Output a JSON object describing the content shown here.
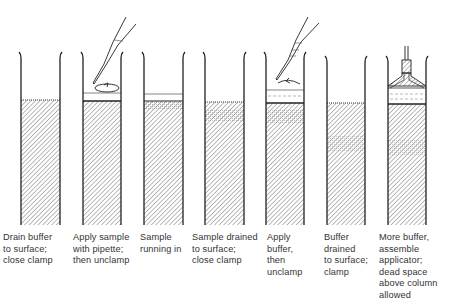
{
  "diagram": {
    "type": "column-chromatography-sample-loading-steps",
    "steps": [
      {
        "label": "Drain buffer\nto surface;\nclose clamp",
        "x": 3
      },
      {
        "label": "Apply sample\nwith pipette;\nthen unclamp",
        "x": 73
      },
      {
        "label": "Sample\nrunning in",
        "x": 140
      },
      {
        "label": "Sample drained\nto surface;\nclose clamp",
        "x": 192
      },
      {
        "label": "Apply\nbuffer,\nthen\nunclamp",
        "x": 267
      },
      {
        "label": "Buffer\ndrained\nto surface;\nclamp",
        "x": 324
      },
      {
        "label": "More buffer,\nassemble\napplicator;\ndead space\nabove column\nallowed",
        "x": 379
      }
    ],
    "icons": [
      "pipette-icon",
      "swirl-arrow-icon",
      "applicator-icon"
    ],
    "colors": {
      "line": "#222222",
      "hatch": "#555555",
      "background": "#ffffff"
    }
  }
}
